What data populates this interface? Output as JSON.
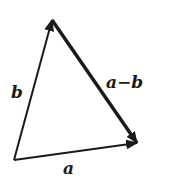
{
  "diagram": {
    "vectors": [
      {
        "name": "a",
        "label": "a",
        "from": [
          14,
          160
        ],
        "to": [
          137,
          143
        ]
      },
      {
        "name": "b",
        "label": "b",
        "from": [
          14,
          160
        ],
        "to": [
          52,
          20
        ]
      },
      {
        "name": "a-b",
        "label": "a−b",
        "from": [
          52,
          20
        ],
        "to": [
          137,
          143
        ]
      }
    ],
    "labels": {
      "a": "a",
      "b": "b",
      "a_minus_b": "a−b"
    },
    "colors": {
      "stroke": "#1a1a1a",
      "background": "#ffffff"
    }
  }
}
